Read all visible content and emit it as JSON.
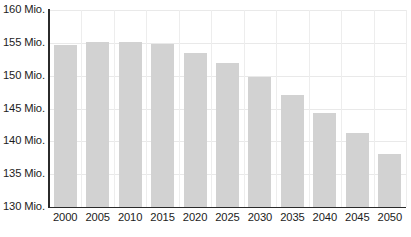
{
  "chart_data": {
    "type": "bar",
    "title": "",
    "subtitle": "",
    "xlabel": "",
    "ylabel": "",
    "unit_suffix": "Mio.",
    "categories": [
      "2000",
      "2005",
      "2010",
      "2015",
      "2020",
      "2025",
      "2030",
      "2035",
      "2040",
      "2045",
      "2050"
    ],
    "values": [
      154.6,
      155.2,
      155.1,
      154.8,
      153.5,
      151.9,
      149.8,
      147.0,
      144.3,
      141.3,
      138.0
    ],
    "ylim": [
      130,
      160
    ],
    "yticks": [
      130,
      135,
      140,
      145,
      150,
      155,
      160
    ],
    "ytick_labels": [
      "130 Mio.",
      "135 Mio.",
      "140 Mio.",
      "145 Mio.",
      "150 Mio.",
      "155 Mio.",
      "160 Mio."
    ],
    "grid": true,
    "grid_axis": "both",
    "legend": false,
    "legend_position": "none",
    "bar_color": "#d2d2d2",
    "axis_color": "#2b2b2b",
    "grid_color": "#e9e9e9",
    "text_color": "#1c1c1c"
  }
}
